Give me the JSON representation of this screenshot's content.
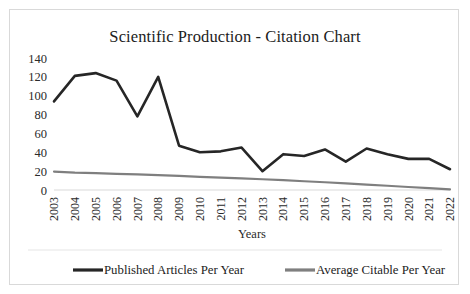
{
  "chart_data": {
    "type": "line",
    "title": "Scientific Production - Citation Chart",
    "xlabel": "Years",
    "ylabel": "",
    "ylim": [
      0,
      140
    ],
    "yticks": [
      0,
      20,
      40,
      60,
      80,
      100,
      120,
      140
    ],
    "grid": false,
    "legend_position": "bottom",
    "categories": [
      "2003",
      "2004",
      "2005",
      "2006",
      "2007",
      "2008",
      "2009",
      "2010",
      "2011",
      "2012",
      "2013",
      "2014",
      "2015",
      "2016",
      "2017",
      "2018",
      "2019",
      "2020",
      "2021",
      "2022"
    ],
    "series": [
      {
        "name": "Published Articles Per Year",
        "color": "#262626",
        "values": [
          94,
          121,
          124,
          116,
          78,
          120,
          47,
          40,
          41,
          45,
          20,
          38,
          36,
          43,
          30,
          44,
          38,
          33,
          33,
          22
        ]
      },
      {
        "name": "Average Citable Per Year",
        "color": "#7f7f7f",
        "values": [
          19.5,
          18.5,
          18.0,
          17.2,
          16.5,
          15.7,
          14.9,
          14.0,
          13.2,
          12.3,
          11.4,
          10.4,
          9.3,
          8.2,
          7.0,
          5.8,
          4.5,
          3.2,
          1.9,
          0.6
        ]
      }
    ]
  },
  "axis": {
    "x_title": "Years",
    "y_tick_labels": [
      "140",
      "120",
      "100",
      "80",
      "60",
      "40",
      "20",
      "0"
    ]
  },
  "legend": {
    "items": [
      {
        "label": "Published Articles Per Year",
        "color": "#262626"
      },
      {
        "label": "Average Citable Per Year",
        "color": "#7f7f7f"
      }
    ]
  },
  "colors": {
    "published_series": "#262626",
    "average_series": "#7f7f7f",
    "baseline": "#d9d9d9",
    "frame_border": "#d9d9d9",
    "text": "#1c1c1c"
  }
}
